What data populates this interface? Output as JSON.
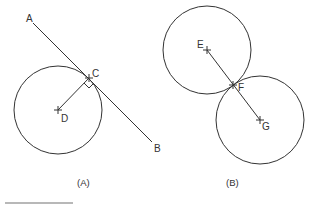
{
  "figure_a": {
    "caption": "(A)",
    "labels": {
      "A": "A",
      "B": "B",
      "C": "C",
      "D": "D"
    },
    "circle": {
      "cx": 58,
      "cy": 110,
      "r": 44
    },
    "tangent_line": {
      "x1": 33,
      "y1": 23,
      "x2": 152,
      "y2": 142
    },
    "radius_segment": {
      "x1": 58,
      "y1": 110,
      "x2": 89,
      "y2": 78
    },
    "right_angle_marker": true
  },
  "figure_b": {
    "caption": "(B)",
    "labels": {
      "E": "E",
      "F": "F",
      "G": "G"
    },
    "circle_e": {
      "cx": 207,
      "cy": 50,
      "r": 44
    },
    "circle_g": {
      "cx": 260,
      "cy": 120,
      "r": 44
    },
    "center_segment": {
      "x1": 207,
      "y1": 50,
      "x2": 260,
      "y2": 120
    }
  },
  "colors": {
    "stroke": "#333333",
    "text": "#333333",
    "bar": "#b8b8b8"
  }
}
